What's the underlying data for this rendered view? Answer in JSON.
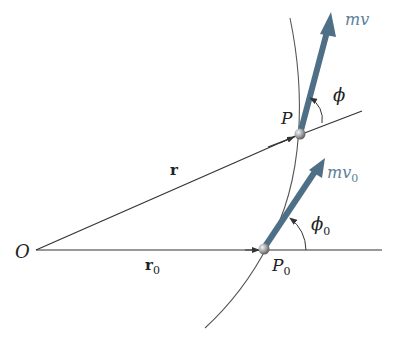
{
  "diagram": {
    "labels": {
      "origin": "O",
      "r": "r",
      "r0": "r",
      "r0_sub": "0",
      "P": "P",
      "P0": "P",
      "P0_sub": "0",
      "mv": "mv",
      "mv0": "mv",
      "mv0_sub": "0",
      "phi": "ϕ",
      "phi0": "ϕ",
      "phi0_sub": "0"
    },
    "colors": {
      "line": "#333333",
      "vector": "#4f6f87",
      "vector_label": "#5d7f98",
      "particle": "#a0a0a0"
    }
  }
}
